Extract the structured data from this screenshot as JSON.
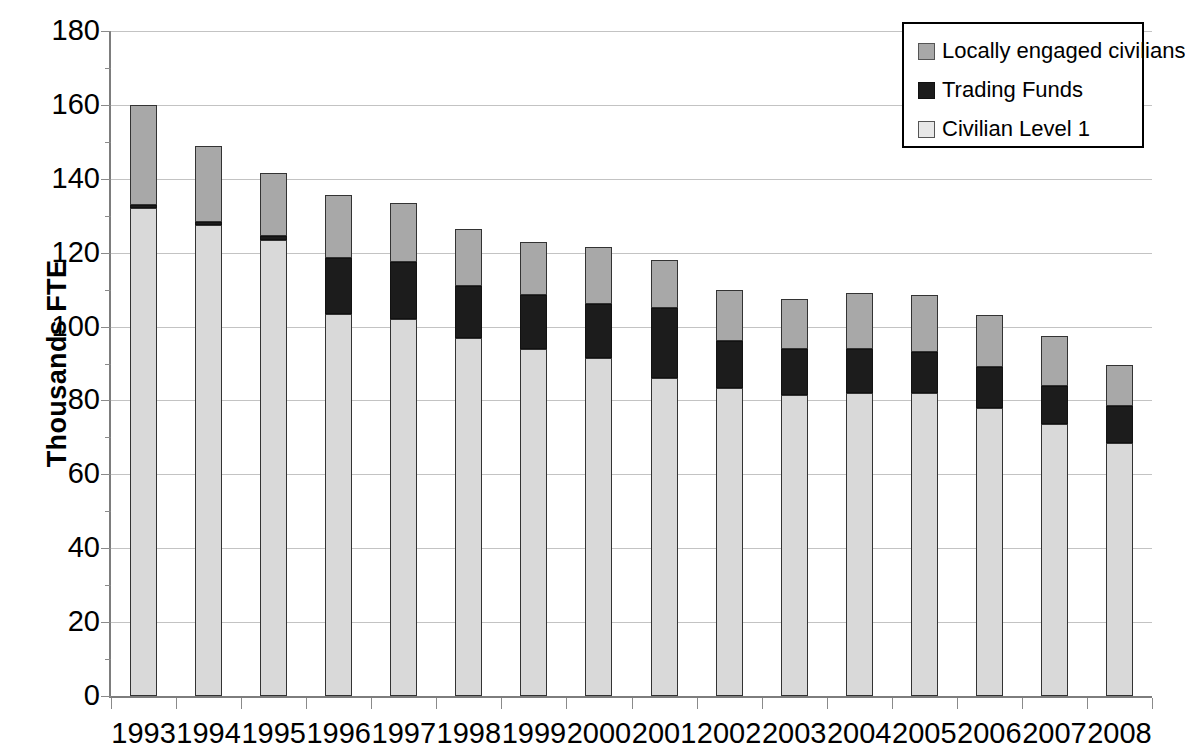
{
  "chart_data": {
    "type": "bar",
    "subtype": "stacked-vertical",
    "title": "",
    "subtitle": "",
    "xlabel": "",
    "ylabel": "Thousands FTE",
    "ylim": [
      0,
      180
    ],
    "ytick_step": 20,
    "yticks": [
      0,
      20,
      40,
      60,
      80,
      100,
      120,
      140,
      160,
      180
    ],
    "ytick_labels": [
      "0",
      "20",
      "40",
      "60",
      "80",
      "100",
      "120",
      "140",
      "160",
      "180"
    ],
    "grid": true,
    "grid_axis": "y",
    "legend_position": "top-right",
    "categories": [
      "1993",
      "1994",
      "1995",
      "1996",
      "1997",
      "1998",
      "1999",
      "2000",
      "2001",
      "2002",
      "2003",
      "2004",
      "2005",
      "2006",
      "2007",
      "2008"
    ],
    "series": [
      {
        "name": "Civilian Level 1",
        "color": "#d9d9d9",
        "values": [
          132.0,
          127.5,
          123.5,
          103.5,
          102.0,
          97.0,
          94.0,
          91.5,
          86.0,
          83.5,
          81.5,
          82.0,
          82.0,
          78.0,
          73.5,
          68.5
        ]
      },
      {
        "name": "Trading Funds",
        "color": "#1c1c1c",
        "values": [
          0.8,
          0.8,
          1.0,
          15.0,
          15.5,
          14.0,
          14.5,
          14.5,
          19.0,
          12.5,
          12.5,
          12.0,
          11.0,
          11.0,
          10.5,
          10.0
        ]
      },
      {
        "name": "Locally engaged civilians",
        "color": "#a8a8a8",
        "values": [
          27.2,
          20.7,
          17.0,
          17.0,
          16.0,
          15.5,
          14.5,
          15.5,
          13.0,
          14.0,
          13.5,
          15.0,
          15.5,
          14.0,
          13.5,
          11.0
        ]
      }
    ],
    "totals": [
      160.0,
      149.0,
      141.5,
      135.5,
      133.5,
      126.5,
      123.0,
      121.5,
      118.0,
      110.0,
      107.5,
      109.0,
      108.5,
      103.0,
      97.5,
      89.5
    ]
  },
  "legend": {
    "items": [
      {
        "label": "Locally engaged civilians",
        "swatch_class": "sw-loc",
        "swatch_name": "legend-swatch-locally-engaged-civilians"
      },
      {
        "label": "Trading Funds",
        "swatch_class": "sw-trade",
        "swatch_name": "legend-swatch-trading-funds"
      },
      {
        "label": "Civilian Level 1",
        "swatch_class": "sw-civ",
        "swatch_name": "legend-swatch-civilian-level-1"
      }
    ]
  }
}
